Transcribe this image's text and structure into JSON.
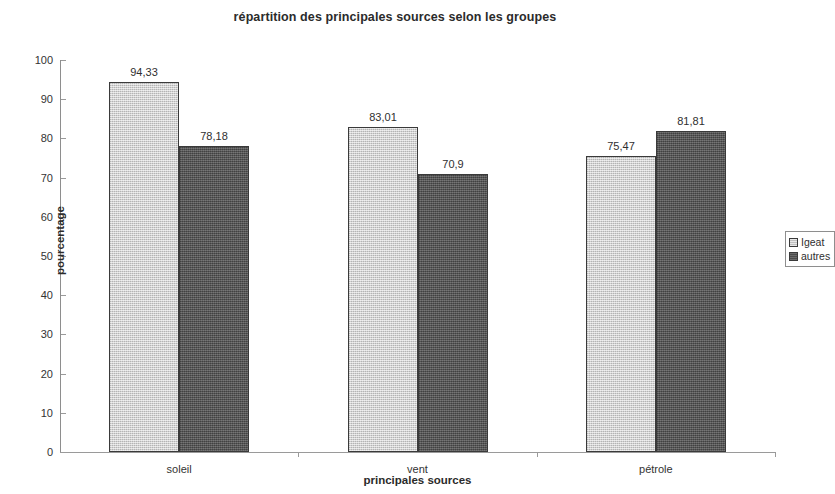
{
  "chart_data": {
    "type": "bar",
    "title": "répartition des principales sources selon les groupes",
    "xlabel": "principales sources",
    "ylabel": "pourcentage",
    "categories": [
      "soleil",
      "vent",
      "pétrole"
    ],
    "series": [
      {
        "name": "Igeat",
        "color": "#cacaca",
        "values": [
          94.33,
          83.01,
          75.47
        ],
        "labels": [
          "94,33",
          "83,01",
          "75,47"
        ]
      },
      {
        "name": "autres",
        "color": "#575757",
        "values": [
          78.18,
          70.9,
          81.81
        ],
        "labels": [
          "78,18",
          "70,9",
          "81,81"
        ]
      }
    ],
    "ylim": [
      0,
      100
    ],
    "yticks": [
      0,
      10,
      20,
      30,
      40,
      50,
      60,
      70,
      80,
      90,
      100
    ],
    "ytick_labels": [
      "0",
      "10",
      "20",
      "30",
      "40",
      "50",
      "60",
      "70",
      "80",
      "90",
      "100"
    ],
    "grid": false,
    "legend_position": "right",
    "legend_entries": [
      "Igeat",
      "autres"
    ]
  }
}
